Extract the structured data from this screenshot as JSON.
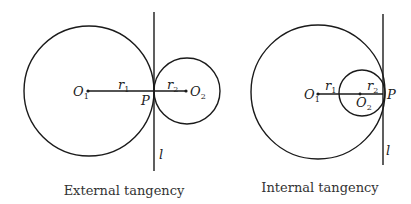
{
  "diagrams": [
    {
      "caption": "External tangency",
      "labels": {
        "O1": "O",
        "O1_sub": "1",
        "O2": "O",
        "O2_sub": "2",
        "r1": "r",
        "r1_sub": "1",
        "r2": "r",
        "r2_sub": "2",
        "P": "P",
        "l": "l"
      }
    },
    {
      "caption": "Internal tangency",
      "labels": {
        "O1": "O",
        "O1_sub": "1",
        "O2": "O",
        "O2_sub": "2",
        "r1": "r",
        "r1_sub": "1",
        "r2": "r",
        "r2_sub": "2",
        "P": "P",
        "l": "l"
      }
    }
  ]
}
